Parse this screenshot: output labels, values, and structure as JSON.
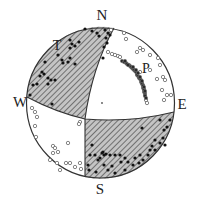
{
  "figure": {
    "type": "focal-mechanism-stereonet",
    "center": [
      100.5,
      103
    ],
    "radius": 74,
    "colors": {
      "outline": "#333333",
      "hatch": "#555555",
      "shade_bg": "#bdbdbd",
      "filled_point": "#111111",
      "open_point": "#666666"
    }
  },
  "labels": {
    "north": "N",
    "south": "S",
    "west": "W",
    "east": "E",
    "t_axis": "T",
    "p_axis": "P"
  },
  "label_positions": {
    "north": [
      102,
      20
    ],
    "south": [
      100,
      194
    ],
    "west": [
      20,
      107
    ],
    "east": [
      182,
      109
    ],
    "t_axis": [
      57,
      50
    ],
    "p_axis": [
      146,
      73
    ]
  },
  "nodal_planes": [
    {
      "name": "plane-1",
      "path": "M114,28 Q92,68 85,119 L85,177"
    },
    {
      "name": "plane-2",
      "path": "M27,97 Q55,112 85,119 Q130,123 174,112"
    }
  ],
  "shaded_quadrants": [
    {
      "name": "nw-compressional-quadrant",
      "path": "M27,97 A74,75 0 0 1 114,28 Q92,68 85,119 Q55,112 27,97 Z"
    },
    {
      "name": "se-compressional-quadrant",
      "path": "M85,119 Q130,123 174,112 A74,75 0 0 1 85,177 Z"
    }
  ],
  "center_point": [
    102,
    103
  ],
  "filled_points": [
    [
      85,
      29
    ],
    [
      92,
      31
    ],
    [
      97,
      33
    ],
    [
      105,
      30
    ],
    [
      108,
      33
    ],
    [
      110,
      35
    ],
    [
      106,
      38
    ],
    [
      99,
      36
    ],
    [
      107,
      43
    ],
    [
      104,
      47
    ],
    [
      103,
      58
    ],
    [
      70,
      40
    ],
    [
      72,
      44
    ],
    [
      75,
      46
    ],
    [
      70,
      48
    ],
    [
      79,
      42
    ],
    [
      58,
      55
    ],
    [
      62,
      60
    ],
    [
      68,
      62
    ],
    [
      63,
      63
    ],
    [
      70,
      58
    ],
    [
      75,
      64
    ],
    [
      45,
      62
    ],
    [
      42,
      72
    ],
    [
      40,
      76
    ],
    [
      44,
      74
    ],
    [
      48,
      78
    ],
    [
      51,
      80
    ],
    [
      48,
      84
    ],
    [
      37,
      84
    ],
    [
      33,
      85
    ],
    [
      30,
      95
    ],
    [
      55,
      80
    ],
    [
      52,
      104
    ],
    [
      142,
      128
    ],
    [
      160,
      120
    ],
    [
      164,
      130
    ],
    [
      163,
      138
    ],
    [
      160,
      143
    ],
    [
      155,
      150
    ],
    [
      152,
      146
    ],
    [
      148,
      155
    ],
    [
      143,
      160
    ],
    [
      139,
      163
    ],
    [
      133,
      165
    ],
    [
      125,
      170
    ],
    [
      115,
      173
    ],
    [
      108,
      170
    ],
    [
      104,
      165
    ],
    [
      98,
      160
    ],
    [
      95,
      155
    ],
    [
      90,
      155
    ],
    [
      88,
      165
    ],
    [
      89,
      170
    ],
    [
      100,
      158
    ],
    [
      103,
      152
    ],
    [
      106,
      154
    ],
    [
      110,
      155
    ],
    [
      115,
      155
    ],
    [
      120,
      155
    ],
    [
      125,
      158
    ],
    [
      128,
      162
    ],
    [
      135,
      158
    ],
    [
      140,
      155
    ],
    [
      150,
      150
    ],
    [
      155,
      140
    ],
    [
      167,
      127
    ],
    [
      170,
      120
    ],
    [
      165,
      145
    ],
    [
      121,
      162
    ],
    [
      112,
      166
    ],
    [
      96,
      172
    ],
    [
      92,
      145
    ],
    [
      104,
      155
    ],
    [
      102,
      153
    ]
  ],
  "p_cluster_points": [
    [
      122,
      61
    ],
    [
      124,
      62
    ],
    [
      126,
      63
    ],
    [
      127,
      64
    ],
    [
      129,
      65
    ],
    [
      130,
      66
    ],
    [
      131,
      67
    ],
    [
      132,
      68
    ],
    [
      133,
      69
    ],
    [
      134,
      70
    ],
    [
      135,
      71
    ],
    [
      136,
      72
    ],
    [
      137,
      74
    ],
    [
      137,
      75
    ],
    [
      138,
      76
    ],
    [
      139,
      77
    ],
    [
      139,
      78
    ],
    [
      140,
      79
    ],
    [
      141,
      80
    ],
    [
      141,
      82
    ],
    [
      142,
      83
    ],
    [
      142,
      84
    ],
    [
      143,
      85
    ],
    [
      143,
      86
    ],
    [
      143,
      88
    ],
    [
      144,
      89
    ],
    [
      144,
      90
    ],
    [
      144,
      92
    ],
    [
      145,
      93
    ],
    [
      145,
      95
    ],
    [
      145,
      96
    ],
    [
      146,
      98
    ],
    [
      125,
      61
    ],
    [
      128,
      65
    ],
    [
      133,
      67
    ],
    [
      136,
      70
    ],
    [
      138,
      73
    ],
    [
      140,
      77
    ],
    [
      142,
      81
    ],
    [
      144,
      87
    ],
    [
      145,
      91
    ]
  ],
  "open_points": [
    [
      111,
      30
    ],
    [
      124,
      33
    ],
    [
      126,
      39
    ],
    [
      140,
      48
    ],
    [
      143,
      50
    ],
    [
      137,
      52
    ],
    [
      150,
      55
    ],
    [
      158,
      58
    ],
    [
      160,
      65
    ],
    [
      163,
      77
    ],
    [
      165,
      80
    ],
    [
      162,
      90
    ],
    [
      167,
      95
    ],
    [
      171,
      95
    ],
    [
      164,
      100
    ],
    [
      147,
      103
    ],
    [
      108,
      52
    ],
    [
      112,
      54
    ],
    [
      115,
      55
    ],
    [
      118,
      56
    ],
    [
      120,
      57
    ],
    [
      150,
      70
    ],
    [
      140,
      72
    ],
    [
      157,
      79
    ],
    [
      146,
      100
    ],
    [
      32,
      108
    ],
    [
      35,
      112
    ],
    [
      37,
      117
    ],
    [
      35,
      126
    ],
    [
      36,
      137
    ],
    [
      53,
      146
    ],
    [
      55,
      148
    ],
    [
      58,
      152
    ],
    [
      53,
      153
    ],
    [
      68,
      143
    ],
    [
      80,
      122
    ],
    [
      79,
      124
    ],
    [
      66,
      163
    ],
    [
      70,
      163
    ],
    [
      75,
      167
    ],
    [
      80,
      163
    ],
    [
      81,
      169
    ],
    [
      60,
      170
    ],
    [
      50,
      160
    ],
    [
      57,
      163
    ]
  ]
}
